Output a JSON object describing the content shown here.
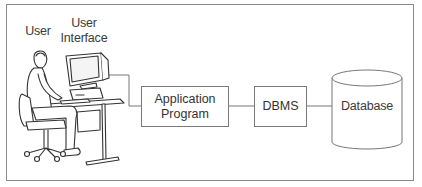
{
  "diagram": {
    "labels": {
      "user": "User",
      "user_interface_line1": "User",
      "user_interface_line2": "Interface"
    },
    "nodes": [
      {
        "id": "app",
        "line1": "Application",
        "line2": "Program"
      },
      {
        "id": "dbms",
        "label": "DBMS"
      },
      {
        "id": "db",
        "label": "Database",
        "shape": "cylinder"
      }
    ],
    "edges": [
      {
        "from": "user-interface",
        "to": "app"
      },
      {
        "from": "app",
        "to": "dbms"
      },
      {
        "from": "dbms",
        "to": "db"
      }
    ],
    "colors": {
      "stroke": "#7a7a7a",
      "text": "#333333",
      "background": "#ffffff"
    }
  }
}
